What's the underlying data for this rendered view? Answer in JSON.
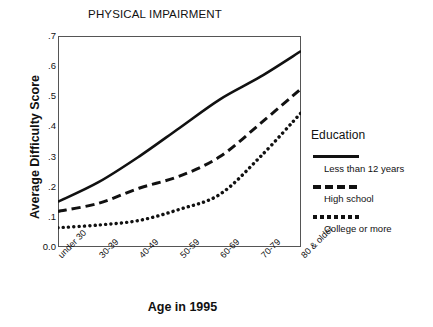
{
  "chart_data": {
    "type": "line",
    "title": "PHYSICAL IMPAIRMENT",
    "xlabel": "Age in 1995",
    "ylabel": "Average Difficulty Score",
    "categories": [
      "under 30",
      "30-39",
      "40-49",
      "50-59",
      "60-69",
      "70-79",
      "80 & older"
    ],
    "yticks": [
      "0.0",
      ".1",
      ".2",
      ".3",
      ".4",
      ".5",
      ".6",
      ".7"
    ],
    "ytick_values": [
      0.0,
      0.1,
      0.2,
      0.3,
      0.4,
      0.5,
      0.6,
      0.7
    ],
    "ylim": [
      0.0,
      0.7
    ],
    "grid": false,
    "legend_position": "right",
    "legend_title": "Education",
    "series": [
      {
        "name": "Less than 12 years",
        "style": "solid",
        "color": "#111111",
        "values": [
          0.15,
          0.215,
          0.3,
          0.395,
          0.49,
          0.565,
          0.65
        ]
      },
      {
        "name": "High school",
        "style": "dashed",
        "color": "#111111",
        "values": [
          0.118,
          0.145,
          0.195,
          0.235,
          0.3,
          0.41,
          0.525
        ]
      },
      {
        "name": "College or more",
        "style": "dotted",
        "color": "#111111",
        "values": [
          0.064,
          0.073,
          0.088,
          0.125,
          0.175,
          0.3,
          0.445
        ]
      }
    ]
  },
  "legend": {
    "title": "Education",
    "entries": [
      {
        "label": "Less than 12 years",
        "style": "solid"
      },
      {
        "label": "High school",
        "style": "dashed"
      },
      {
        "label": "College or more",
        "style": "dotted"
      }
    ]
  },
  "axes": {
    "title": "PHYSICAL IMPAIRMENT",
    "x_title": "Age in 1995",
    "y_title": "Average Difficulty Score"
  }
}
